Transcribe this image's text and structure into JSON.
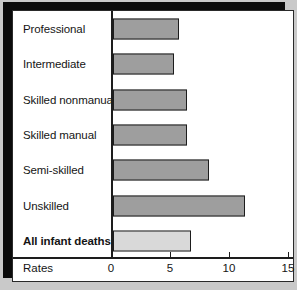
{
  "chart_data": {
    "type": "bar",
    "orientation": "horizontal",
    "title": "",
    "xlabel": "Rates",
    "ylabel": "",
    "categories": [
      "Professional",
      "Intermediate",
      "Skilled nonmanual",
      "Skilled manual",
      "Semi-skilled",
      "Unskilled",
      "All infant deaths"
    ],
    "values": [
      5.5,
      5.1,
      6.2,
      6.2,
      8.0,
      11.0,
      6.5
    ],
    "xlim": [
      0,
      15
    ],
    "xticks": [
      0,
      5,
      10,
      15
    ],
    "xtick_labels": [
      "0",
      "5",
      "10",
      "15"
    ],
    "grid": false,
    "legend": null,
    "emphasis_category": "All infant deaths",
    "colors": {
      "bar_fill": "#9e9e9e",
      "bar_fill_total": "#d9d9d9",
      "bar_edge": "#1d1d1d",
      "panel_background": "#ffffff",
      "page_background": "#c9c9c9",
      "shadow": "#0b0b0b",
      "text": "#151515"
    }
  },
  "axis": {
    "caption": "Rates",
    "ticks": [
      {
        "label": "0",
        "value": 0
      },
      {
        "label": "5",
        "value": 5
      },
      {
        "label": "10",
        "value": 10
      },
      {
        "label": "15",
        "value": 15
      }
    ]
  },
  "rows": [
    {
      "label": "Professional",
      "value": 5.5,
      "bold": false,
      "light": false
    },
    {
      "label": "Intermediate",
      "value": 5.1,
      "bold": false,
      "light": false
    },
    {
      "label": "Skilled nonmanual",
      "value": 6.2,
      "bold": false,
      "light": false
    },
    {
      "label": "Skilled manual",
      "value": 6.2,
      "bold": false,
      "light": false
    },
    {
      "label": "Semi-skilled",
      "value": 8.0,
      "bold": false,
      "light": false
    },
    {
      "label": "Unskilled",
      "value": 11.0,
      "bold": false,
      "light": false
    },
    {
      "label": "All infant deaths",
      "value": 6.5,
      "bold": true,
      "light": true
    }
  ]
}
